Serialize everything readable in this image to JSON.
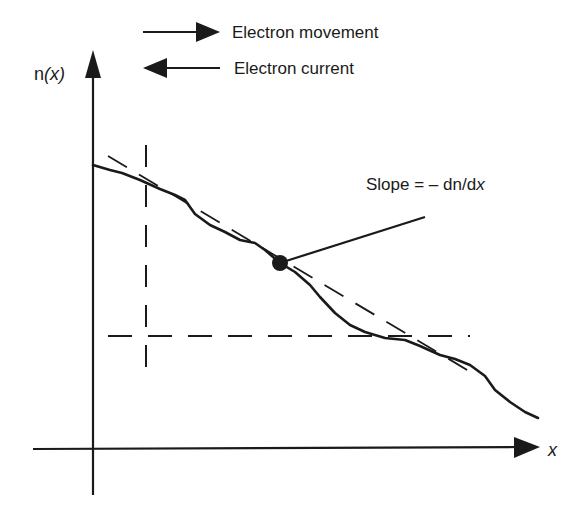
{
  "diagram": {
    "y_axis_label_prefix": "n",
    "y_axis_label_arg": "(x)",
    "x_axis_label": "x",
    "legend": [
      {
        "direction": "right",
        "label": "Electron movement"
      },
      {
        "direction": "left",
        "label": "Electron current"
      }
    ],
    "slope_annotation_prefix": "Slope = – dn/d",
    "slope_annotation_var": "x",
    "colors": {
      "ink": "#1a1a1a",
      "background": "#ffffff"
    }
  }
}
